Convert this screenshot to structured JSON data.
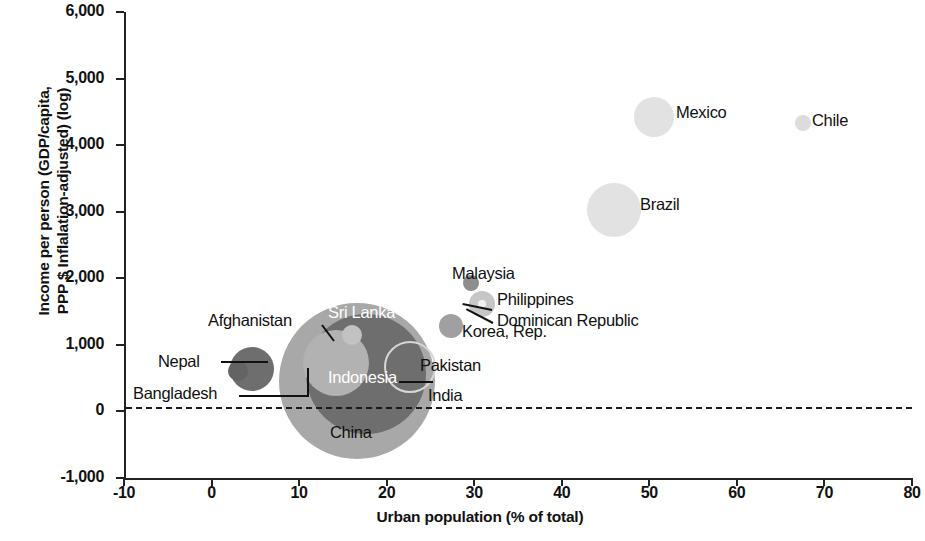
{
  "chart_data": {
    "type": "scatter",
    "title": "",
    "xlabel": "Urban population (% of total)",
    "ylabel_line1": "Income per person (GDP/capita,",
    "ylabel_line2": "PPP $ Inflalation-adjusted) (log)",
    "xlim": [
      -10,
      80
    ],
    "ylim": [
      -1000,
      6000
    ],
    "xticks": [
      "-10",
      "0",
      "10",
      "20",
      "30",
      "40",
      "50",
      "60",
      "70",
      "80"
    ],
    "xtick_values": [
      -10,
      0,
      10,
      20,
      30,
      40,
      50,
      60,
      70,
      80
    ],
    "yticks": [
      "-1,000",
      "0",
      "1,000",
      "2,000",
      "3,000",
      "4,000",
      "5,000",
      "6,000"
    ],
    "ytick_values": [
      -1000,
      0,
      1000,
      2000,
      3000,
      4000,
      5000,
      6000
    ],
    "grid": false,
    "legend": "none",
    "reference_line": {
      "axis": "y",
      "value": 0,
      "style": "dashed"
    },
    "bubble_meaning": "bubble area proportional to country population",
    "points": [
      {
        "name": "Mexico",
        "x": 50.5,
        "y": 4430,
        "r_px": 20,
        "color": "#e2e2e2",
        "fill": true,
        "label_pos": "right"
      },
      {
        "name": "Chile",
        "x": 67.5,
        "y": 4340,
        "r_px": 8,
        "color": "#dcdcdc",
        "fill": true,
        "label_pos": "right"
      },
      {
        "name": "Brazil",
        "x": 46.0,
        "y": 3030,
        "r_px": 27,
        "color": "#e2e2e2",
        "fill": true,
        "label_pos": "right"
      },
      {
        "name": "Malaysia",
        "x": 29.6,
        "y": 1930,
        "r_px": 8,
        "color": "#8d8d8d",
        "fill": true,
        "label_pos": "right"
      },
      {
        "name": "Philippines",
        "x": 30.9,
        "y": 1610,
        "r_px": 13,
        "color": "#c6c6c6",
        "fill": true,
        "label_pos": "leader-right"
      },
      {
        "name": "Dominican Republic",
        "x": 30.9,
        "y": 1610,
        "r_px": 4,
        "color": "#f0f0f0",
        "fill": true,
        "label_pos": "leader-right"
      },
      {
        "name": "Korea, Rep.",
        "x": 27.3,
        "y": 1280,
        "r_px": 12,
        "color": "#a0a0a0",
        "fill": true,
        "label_pos": "right"
      },
      {
        "name": "China",
        "x": 16.6,
        "y": 460,
        "r_px": 78,
        "color": "#a8a8a8",
        "fill": true,
        "label_pos": "below"
      },
      {
        "name": "India",
        "x": 17.6,
        "y": 560,
        "r_px": 60,
        "color": "#6e6e6e",
        "fill": true,
        "label_pos": "leader-right"
      },
      {
        "name": "Indonesia",
        "x": 14.2,
        "y": 720,
        "r_px": 33,
        "color": "#b2b2b2",
        "fill": true,
        "label_pos": "inside-white"
      },
      {
        "name": "Sri Lanka",
        "x": 16.0,
        "y": 1150,
        "r_px": 10,
        "color": "#c2c2c2",
        "fill": true,
        "label_pos": "inside-white"
      },
      {
        "name": "Pakistan",
        "x": 22.4,
        "y": 700,
        "r_px": 24,
        "color": "#777777",
        "fill": false,
        "label_pos": "right"
      },
      {
        "name": "Bangladesh",
        "x": 4.6,
        "y": 640,
        "r_px": 22,
        "color": "#6e6e6e",
        "fill": true,
        "label_pos": "leader-left"
      },
      {
        "name": "Nepal",
        "x": 3.0,
        "y": 600,
        "r_px": 10,
        "color": "#636363",
        "fill": true,
        "label_pos": "leader-left"
      },
      {
        "name": "Afghanistan",
        "x": 6.8,
        "y": 900,
        "r_px": 0,
        "color": "#6e6e6e",
        "fill": true,
        "label_pos": "leader-up-left"
      }
    ]
  },
  "labels": {
    "mexico": "Mexico",
    "chile": "Chile",
    "brazil": "Brazil",
    "malaysia": "Malaysia",
    "philippines": "Philippines",
    "dominican_republic": "Dominican Republic",
    "korea": "Korea, Rep.",
    "china": "China",
    "india": "India",
    "indonesia": "Indonesia",
    "sri_lanka": "Sri Lanka",
    "pakistan": "Pakistan",
    "bangladesh": "Bangladesh",
    "nepal": "Nepal",
    "afghanistan": "Afghanistan"
  }
}
